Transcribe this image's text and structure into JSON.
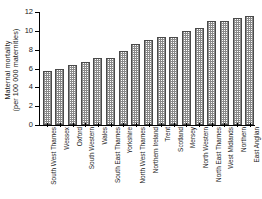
{
  "chart_data": {
    "type": "bar",
    "title": "",
    "xlabel": "",
    "ylabel": "Maternal mortality (per 100 000 maternities)",
    "ylabel_line1": "Maternal mortality",
    "ylabel_line2": "(per 100 000 maternities)",
    "ylim": [
      0,
      12
    ],
    "ytick_labels": [
      "0",
      "2",
      "4",
      "6",
      "8",
      "10",
      "12"
    ],
    "yticks": [
      0,
      2,
      4,
      6,
      8,
      10,
      12
    ],
    "grid": false,
    "legend": "none",
    "bar_fill": "crosshatch-grey",
    "bar_edge_color": "#4a4a4a",
    "bar_fill_color": "#8a8a8a",
    "axis_color": "#000000",
    "background_color": "#ffffff",
    "categories": [
      "South West Thames",
      "Wessex",
      "Oxford",
      "South Western",
      "Wales",
      "South East Thames",
      "Yorkshire",
      "North West Thames",
      "Northern Ireland",
      "Trent",
      "Scotland",
      "Mersey",
      "North Western",
      "North East Thames",
      "West Midlands",
      "Northern",
      "East Anglian"
    ],
    "values": [
      5.7,
      6.0,
      6.4,
      6.7,
      7.1,
      7.1,
      7.9,
      8.6,
      9.0,
      9.3,
      9.3,
      10.0,
      10.3,
      11.0,
      11.0,
      11.4,
      11.6
    ]
  }
}
